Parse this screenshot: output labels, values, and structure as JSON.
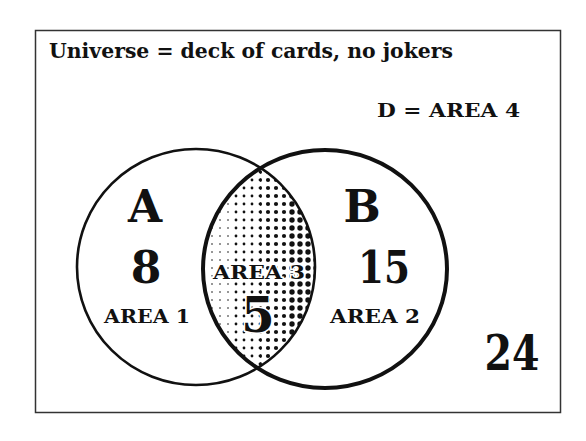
{
  "diagram": {
    "type": "venn",
    "title": "Universe = deck of cards, no jokers",
    "complement_label": "D = AREA 4",
    "sets": [
      {
        "name": "A",
        "count": "8",
        "area_label": "AREA 1"
      },
      {
        "name": "B",
        "count": "15",
        "area_label": "AREA 2"
      }
    ],
    "intersection": {
      "area_label": "AREA 3",
      "count": "5"
    },
    "outside_count": "24",
    "colors": {
      "ink": "#111111",
      "background": "#ffffff",
      "frame": "#333333"
    }
  }
}
